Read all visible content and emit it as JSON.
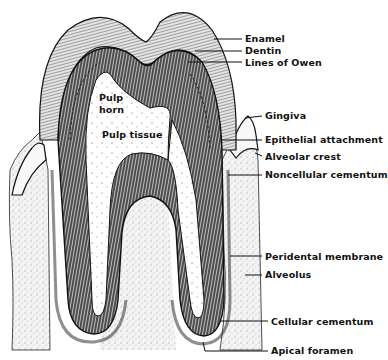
{
  "figure": {
    "colors": {
      "ink": "#111111",
      "paper": "#ffffff",
      "enamel_fill": "#d6d6d6",
      "dentin_fill": "#9a9a9a",
      "bone_fill": "#eeeeee"
    }
  },
  "inner_labels": {
    "pulp_horn_line1": "Pulp",
    "pulp_horn_line2": "horn",
    "pulp_tissue": "Pulp tissue"
  },
  "callouts": [
    {
      "id": "enamel",
      "label": "Enamel",
      "x": 245,
      "y": 33,
      "line": [
        214,
        39,
        242,
        39
      ]
    },
    {
      "id": "dentin",
      "label": "Dentin",
      "x": 245,
      "y": 45,
      "line": [
        195,
        51,
        242,
        51
      ]
    },
    {
      "id": "lines-of-owen",
      "label": "Lines of Owen",
      "x": 245,
      "y": 57,
      "line": [
        188,
        62,
        242,
        62
      ]
    },
    {
      "id": "gingiva",
      "label": "Gingiva",
      "x": 265,
      "y": 110,
      "line": [
        245,
        118,
        262,
        116
      ]
    },
    {
      "id": "epithelial-attachment",
      "label": "Epithelial attachment",
      "x": 265,
      "y": 134,
      "line": [
        222,
        140,
        262,
        140
      ]
    },
    {
      "id": "alveolar-crest",
      "label": "Alveolar crest",
      "x": 265,
      "y": 151,
      "line": [
        255,
        153,
        262,
        156
      ]
    },
    {
      "id": "noncellular-cementum",
      "label": "Noncellular cementum",
      "x": 265,
      "y": 169,
      "line": [
        228,
        175,
        262,
        175
      ]
    },
    {
      "id": "peridental-membrane",
      "label": "Peridental membrane",
      "x": 265,
      "y": 251,
      "line": [
        230,
        256,
        262,
        256
      ]
    },
    {
      "id": "alveolus",
      "label": "Alveolus",
      "x": 265,
      "y": 269,
      "line": [
        245,
        275,
        262,
        275
      ]
    },
    {
      "id": "cellular-cementum",
      "label": "Cellular cementum",
      "x": 271,
      "y": 317,
      "line": [
        220,
        321,
        268,
        321
      ]
    },
    {
      "id": "apical-foramen",
      "label": "Apical foramen",
      "x": 271,
      "y": 339,
      "line": [
        203,
        342,
        205,
        351,
        268,
        351
      ]
    }
  ]
}
